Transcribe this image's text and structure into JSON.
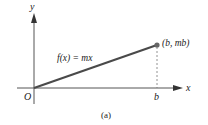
{
  "figure": {
    "caption": "(a)",
    "function_label": "f(x) = mx",
    "point_label": "(b, mb)",
    "axes": {
      "x_label": "x",
      "y_label": "y",
      "origin_label": "O",
      "x_tick_label": "b"
    },
    "colors": {
      "line": "#4a4a4a",
      "axis": "#555555",
      "point": "#666666",
      "dashed": "#777777",
      "text": "#222222"
    },
    "geometry": {
      "origin": [
        34,
        88
      ],
      "endpoint": [
        157,
        45
      ]
    }
  }
}
